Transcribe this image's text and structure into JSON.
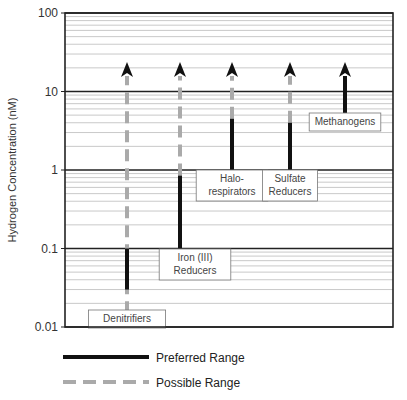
{
  "chart_data": {
    "type": "range",
    "title": "",
    "xlabel": "",
    "ylabel": "Hydrogen Concentration (nM)",
    "yscale": "log",
    "ylim": [
      0.01,
      100
    ],
    "yticks": [
      {
        "value": 100,
        "label": "100"
      },
      {
        "value": 10,
        "label": "10"
      },
      {
        "value": 1,
        "label": "1"
      },
      {
        "value": 0.1,
        "label": "0.1"
      },
      {
        "value": 0.01,
        "label": "0.01"
      }
    ],
    "grid": "log minor + major",
    "series": [
      {
        "name": "Denitrifiers",
        "label_lines": [
          "Denitrifiers"
        ],
        "preferred": [
          0.03,
          0.1
        ],
        "possible": [
          0.015,
          20
        ],
        "arrow": "possible",
        "label_at": 0.013
      },
      {
        "name": "Iron (III) Reducers",
        "label_lines": [
          "Iron  (III)",
          "Reducers"
        ],
        "preferred": [
          0.1,
          0.85
        ],
        "possible": [
          0.85,
          20
        ],
        "arrow": "possible",
        "label_at": 0.075
      },
      {
        "name": "Halo-respirators",
        "label_lines": [
          "Halo-",
          "respirators"
        ],
        "preferred": [
          1,
          4.5
        ],
        "possible": [
          4.5,
          20
        ],
        "arrow": "possible",
        "label_at": 0.75
      },
      {
        "name": "Sulfate Reducers",
        "label_lines": [
          "Sulfate",
          "Reducers"
        ],
        "preferred": [
          1,
          4
        ],
        "possible": [
          4,
          20
        ],
        "arrow": "possible",
        "label_at": 0.75
      },
      {
        "name": "Methanogens",
        "label_lines": [
          "Methanogens"
        ],
        "preferred": [
          5,
          20
        ],
        "possible": null,
        "arrow": "preferred",
        "label_at": 3.8
      }
    ],
    "legend": {
      "placement": "bottom-left",
      "items": [
        {
          "label": "Preferred Range",
          "style": "solid",
          "color": "#111111"
        },
        {
          "label": "Possible Range",
          "style": "dashed",
          "color": "#aaaaaa"
        }
      ]
    },
    "colors": {
      "preferred": "#111111",
      "possible": "#aaaaaa",
      "major_grid": "#222222",
      "minor_grid": "#bbbbbb"
    }
  }
}
